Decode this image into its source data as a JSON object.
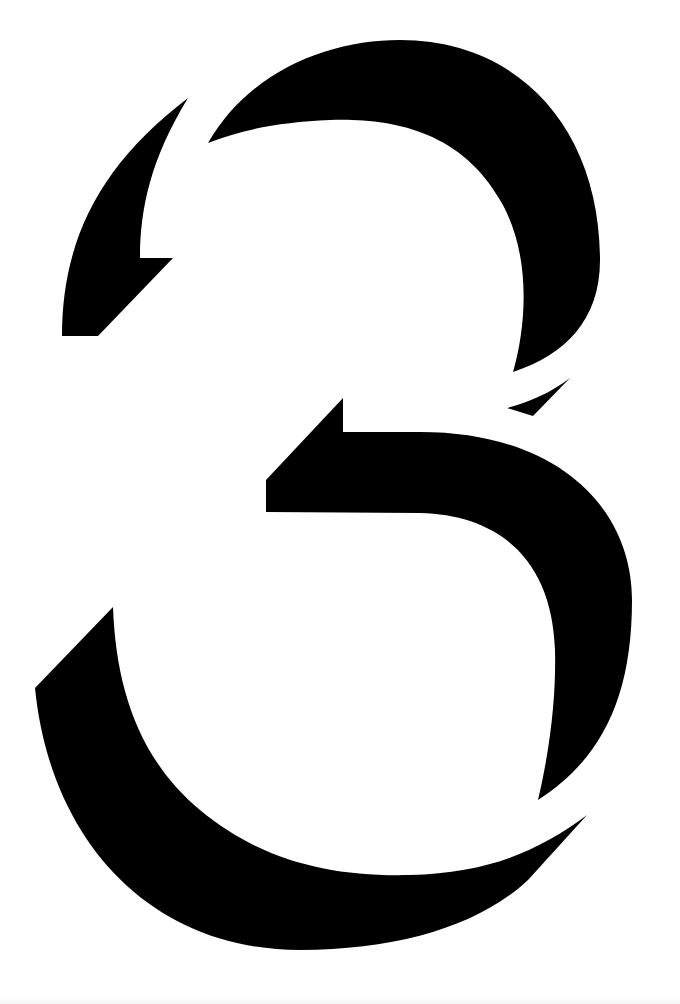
{
  "artwork": {
    "subject": "stylized numeral 3",
    "background_color": "#ffffff",
    "fill_color": "#000000",
    "parts": [
      {
        "name": "top-arc",
        "d": "M208,143 C250,70 330,40 400,40 C520,40 600,130 600,260 C600,320 565,355 513,372 C528,320 530,250 500,200 C460,130 390,118 330,120 C280,122 240,130 208,143 Z"
      },
      {
        "name": "upper-left-fragment",
        "d": "M188,98 C150,160 140,210 140,258 L173,258 L98,336 L62,336 C62,240 100,165 188,98 Z"
      },
      {
        "name": "small-sliver",
        "d": "M507,408 C530,402 552,392 570,378 L533,416 Z"
      },
      {
        "name": "middle-stroke",
        "d": "M266,480 L343,398 L343,432 L420,432 C560,432 632,510 632,600 C632,700 600,760 538,800 C552,740 556,690 555,650 C552,560 500,515 420,513 L266,512 Z"
      },
      {
        "name": "bottom-bowl",
        "d": "M113,607 C116,690 140,760 200,810 C260,860 330,877 410,875 C490,873 540,850 587,815 L528,880 C480,925 400,950 300,950 C150,950 50,840 35,688 Z"
      }
    ]
  }
}
